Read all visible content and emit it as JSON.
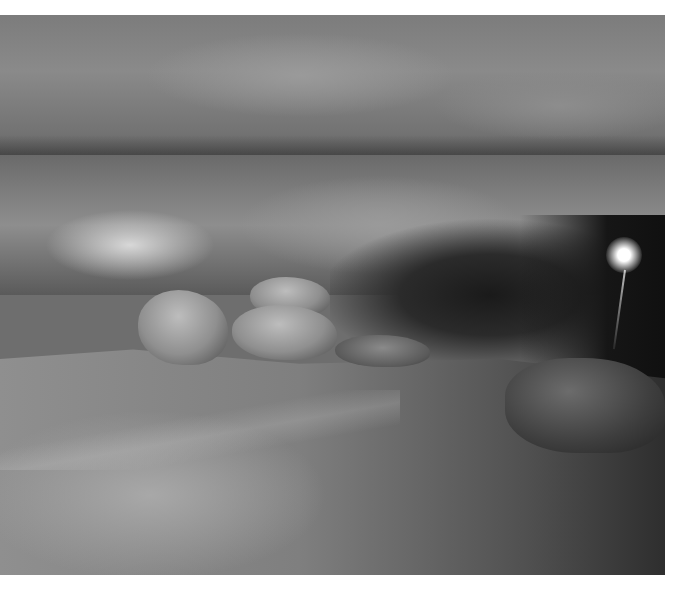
{
  "image": {
    "subject": "cave interior with lion-shaped rock formations",
    "palette": {
      "background": "#ffffff",
      "rock_light": "#bdbdbd",
      "rock_mid": "#8a8a8a",
      "shadow": "#1a1a1a",
      "lamp": "#ffffff"
    },
    "elements": [
      "cave-ceiling",
      "illuminated-wall",
      "lion-rock-formations",
      "cave-floor",
      "boulder-right",
      "cave-lamp"
    ]
  }
}
